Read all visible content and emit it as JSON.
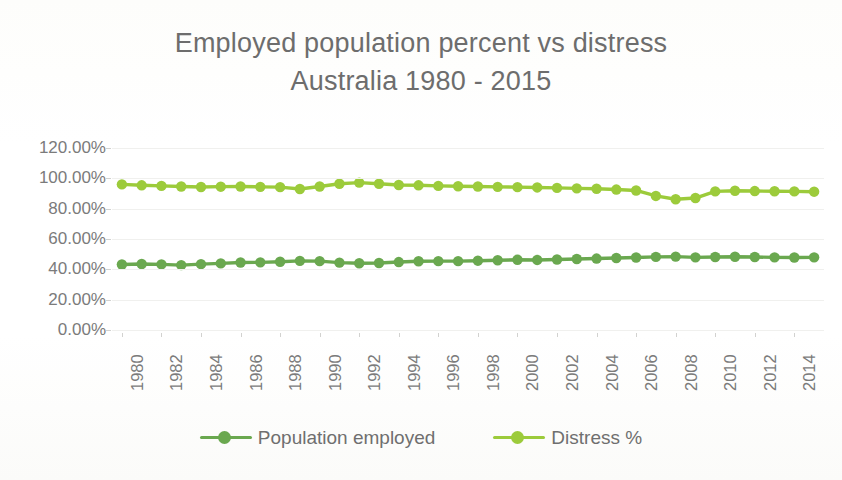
{
  "title": {
    "line1": "Employed population percent vs distress",
    "line2": "Australia 1980 - 2015"
  },
  "legend": {
    "items": [
      {
        "label": "Population employed",
        "color": "#6aa84f",
        "name": "legend-population-employed"
      },
      {
        "label": "Distress %",
        "color": "#9ccb3b",
        "name": "legend-distress"
      }
    ]
  },
  "chart_data": {
    "type": "line",
    "title": "Employed population percent vs distress Australia 1980 - 2015",
    "xlabel": "",
    "ylabel": "",
    "ylim": [
      0,
      120
    ],
    "yticks": [
      0,
      20,
      40,
      60,
      80,
      100,
      120
    ],
    "ytick_labels": [
      "0.00%",
      "20.00%",
      "40.00%",
      "60.00%",
      "80.00%",
      "100.00%",
      "120.00%"
    ],
    "grid": true,
    "legend_position": "bottom",
    "x": [
      1980,
      1981,
      1982,
      1983,
      1984,
      1985,
      1986,
      1987,
      1988,
      1989,
      1990,
      1991,
      1992,
      1993,
      1994,
      1995,
      1996,
      1997,
      1998,
      1999,
      2000,
      2001,
      2002,
      2003,
      2004,
      2005,
      2006,
      2007,
      2008,
      2009,
      2010,
      2011,
      2012,
      2013,
      2014,
      2015
    ],
    "xtick_labels": [
      "1980",
      "1982",
      "1984",
      "1986",
      "1988",
      "1990",
      "1992",
      "1994",
      "1996",
      "1998",
      "2000",
      "2002",
      "2004",
      "2006",
      "2008",
      "2010",
      "2012",
      "2014"
    ],
    "series": [
      {
        "name": "Population employed",
        "color": "#6aa84f",
        "values": [
          43.2,
          43.5,
          43.3,
          42.8,
          43.4,
          43.9,
          44.5,
          44.6,
          45.0,
          45.6,
          45.4,
          44.4,
          44.0,
          44.2,
          44.8,
          45.3,
          45.4,
          45.4,
          45.7,
          46.0,
          46.3,
          46.2,
          46.5,
          46.8,
          47.1,
          47.5,
          47.8,
          48.2,
          48.4,
          47.9,
          48.1,
          48.3,
          48.1,
          47.9,
          47.8,
          47.9
        ]
      },
      {
        "name": "Distress %",
        "color": "#9ccb3b",
        "values": [
          96.0,
          95.4,
          95.0,
          94.6,
          94.3,
          94.5,
          94.6,
          94.4,
          94.2,
          93.0,
          94.6,
          96.4,
          97.2,
          96.4,
          95.6,
          95.4,
          95.0,
          94.8,
          94.6,
          94.4,
          94.2,
          94.0,
          93.7,
          93.4,
          93.1,
          92.6,
          92.0,
          88.4,
          86.2,
          87.0,
          91.4,
          91.8,
          91.6,
          91.5,
          91.4,
          91.2
        ]
      }
    ]
  }
}
